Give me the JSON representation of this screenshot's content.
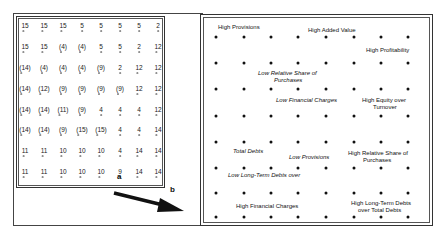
{
  "left_grid": {
    "rows": [
      [
        "15",
        "15",
        "15",
        "5",
        "5",
        "5",
        "5",
        "2"
      ],
      [
        "15",
        "15",
        "(4)",
        "(4)",
        "5",
        "5",
        "2",
        "12"
      ],
      [
        "(14)",
        "(4)",
        "(4)",
        "(4)",
        "(9)",
        "2",
        "12",
        "12"
      ],
      [
        "(14)",
        "(12)",
        "(9)",
        "(9)",
        "(9)",
        "(9)",
        "12",
        "12"
      ],
      [
        "(14)",
        "(14)",
        "(11)",
        "(9)",
        "4",
        "4",
        "4",
        "12"
      ],
      [
        "(14)",
        "(14)",
        "(9)",
        "(15)",
        "(15)",
        "4",
        "4",
        "14"
      ],
      [
        "11",
        "11",
        "10",
        "10",
        "10",
        "4",
        "14",
        "14"
      ],
      [
        "11",
        "11",
        "10",
        "10",
        "10",
        "9",
        "14",
        "14"
      ]
    ],
    "col_x": [
      25,
      44,
      63,
      82,
      101,
      120,
      139,
      158
    ],
    "row_y": [
      25,
      46,
      67,
      88,
      109,
      129,
      150,
      171
    ]
  },
  "arrow": {
    "label_start": "a",
    "label_end": "b"
  },
  "right_map": {
    "col_x": [
      216,
      244,
      271,
      298,
      326,
      354,
      381,
      408
    ],
    "row_y": [
      37,
      63,
      89,
      116,
      142,
      168,
      193,
      217
    ],
    "labels": [
      {
        "text": "High Provisions",
        "x": 218,
        "y": 24,
        "italic": false
      },
      {
        "text": "High Added Value",
        "x": 308,
        "y": 27,
        "italic": false
      },
      {
        "text": "High Profitability",
        "x": 366,
        "y": 47,
        "italic": false
      },
      {
        "text": "Low Relative Share of",
        "x": 258,
        "y": 70,
        "italic": true
      },
      {
        "text": "Purchases",
        "x": 274,
        "y": 77,
        "italic": true
      },
      {
        "text": "Low Financial Charges",
        "x": 276,
        "y": 97,
        "italic": true
      },
      {
        "text": "High Equity over",
        "x": 362,
        "y": 97,
        "italic": false
      },
      {
        "text": "Turnover",
        "x": 373,
        "y": 104,
        "italic": false
      },
      {
        "text": "Total Debts",
        "x": 233,
        "y": 148,
        "italic": true
      },
      {
        "text": "Low Provisions",
        "x": 289,
        "y": 154,
        "italic": true
      },
      {
        "text": "High Relative Share of",
        "x": 348,
        "y": 150,
        "italic": false
      },
      {
        "text": "Purchases",
        "x": 363,
        "y": 157,
        "italic": false
      },
      {
        "text": "Low Long-Term Debts over",
        "x": 228,
        "y": 172,
        "italic": true
      },
      {
        "text": "High Financial Charges",
        "x": 236,
        "y": 203,
        "italic": false
      },
      {
        "text": "High Long-Term Debts",
        "x": 351,
        "y": 200,
        "italic": false
      },
      {
        "text": "over Total Debts",
        "x": 358,
        "y": 207,
        "italic": false
      }
    ]
  }
}
